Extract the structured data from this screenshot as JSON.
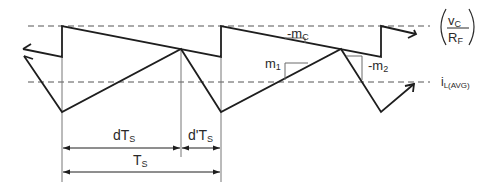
{
  "diagram": {
    "labels": {
      "control_fraction": {
        "num_main": "v",
        "num_sub": "C",
        "den_main": "R",
        "den_sub": "F"
      },
      "avg_current": {
        "main": "i",
        "sub": "L(AVG)"
      },
      "slope_comp": {
        "main": "-m",
        "sub": "C"
      },
      "up_slope": {
        "main": "m",
        "sub": "1"
      },
      "down_slope": {
        "main": "-m",
        "sub": "2"
      },
      "on_time": {
        "main": "dT",
        "sub": "S"
      },
      "off_time": {
        "main": "d'T",
        "sub": "S"
      },
      "period": {
        "main": "T",
        "sub": "S"
      }
    },
    "colors": {
      "waveform": "#1e1e1e",
      "guide": "#707070",
      "dashed": "#555555",
      "slope_marker": "#6a6a6a",
      "text": "#2a2a2a"
    },
    "nodes": {
      "upper_ramp_level": 26,
      "upper_ramp_valley": 57,
      "avg_line": 82,
      "current_peak": 49,
      "current_valley": 112,
      "period_starts_x": [
        62,
        221,
        381
      ],
      "peak_x": [
        181,
        341
      ]
    }
  }
}
